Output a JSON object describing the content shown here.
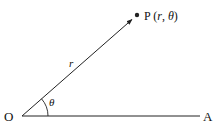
{
  "diagram": {
    "type": "polar-coordinates",
    "points": {
      "origin": {
        "label": "O",
        "x": 22,
        "y": 116
      },
      "axis_end": {
        "label": "A",
        "x": 200,
        "y": 116
      },
      "point": {
        "label_main": "P",
        "label_open": " (",
        "label_r": "r",
        "label_sep": ", ",
        "label_theta": "θ",
        "label_close": ")",
        "x": 137,
        "y": 15
      }
    },
    "radius_label": "r",
    "angle_label": "θ",
    "colors": {
      "stroke": "#222222",
      "text": "#111111",
      "background": "#ffffff"
    }
  }
}
